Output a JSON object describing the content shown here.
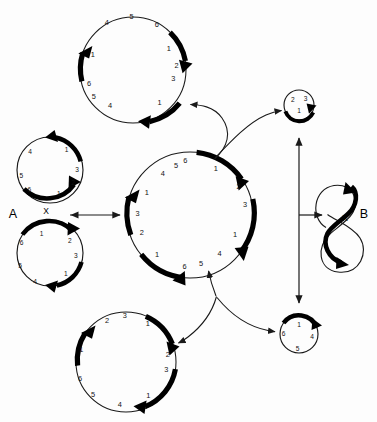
{
  "figure": {
    "title": "",
    "background_color": "#fdfdfd",
    "ink_color": "#000000",
    "width": 377,
    "height": 422
  },
  "labels": {
    "a": "A",
    "b": "B",
    "x_left": "X",
    "x_right": "X"
  },
  "chromosomes": {
    "center": {
      "name": "center-ring",
      "cx": 190,
      "cy": 215,
      "r": 63,
      "markers": [
        "6",
        "1",
        "2",
        "3",
        "1",
        "4",
        "5",
        "6",
        "1",
        "2",
        "3",
        "1",
        "4",
        "5"
      ]
    },
    "top": {
      "name": "top-ring",
      "cx": 133,
      "cy": 70,
      "r": 53,
      "markers": [
        "4",
        "5",
        "6",
        "1",
        "2",
        "3",
        "1",
        "4",
        "5",
        "6",
        "1"
      ]
    },
    "bottom": {
      "name": "bottom-ring",
      "cx": 126,
      "cy": 362,
      "r": 50,
      "markers": [
        "2",
        "3",
        "1",
        "2",
        "3",
        "1",
        "4",
        "5",
        "6",
        "1"
      ]
    },
    "upper_left": {
      "name": "upper-left-ring",
      "cx": 50,
      "cy": 170,
      "r": 33,
      "markers": [
        "1",
        "3",
        "2",
        "1",
        "6",
        "5",
        "4"
      ]
    },
    "lower_left": {
      "name": "lower-left-ring",
      "cx": 50,
      "cy": 253,
      "r": 33,
      "markers": [
        "1",
        "2",
        "3",
        "1",
        "4",
        "5",
        "6"
      ]
    },
    "small_top_right": {
      "name": "small-top-right-ring",
      "cx": 299,
      "cy": 105,
      "r": 15,
      "markers": [
        "2",
        "3",
        "1"
      ]
    },
    "small_bottom_right": {
      "name": "small-bottom-right-ring",
      "cx": 299,
      "cy": 334,
      "r": 19,
      "markers": [
        "1",
        "4",
        "5",
        "6"
      ]
    },
    "figure_eight": {
      "name": "figure-eight-ring",
      "upper_cx": 340,
      "upper_cy": 200,
      "upper_r": 17,
      "lower_cx": 342,
      "lower_cy": 246,
      "lower_r": 24
    }
  },
  "marker_values": {
    "center": [
      {
        "v": "6",
        "ang": -95
      },
      {
        "v": "1",
        "ang": -62
      },
      {
        "v": "2",
        "ang": -30
      },
      {
        "v": "3",
        "ang": -10
      },
      {
        "v": "1",
        "ang": 22
      },
      {
        "v": "4",
        "ang": 50
      },
      {
        "v": "5",
        "ang": 73
      },
      {
        "v": "6",
        "ang": 95
      },
      {
        "v": "1",
        "ang": 122
      },
      {
        "v": "2",
        "ang": 152
      },
      {
        "v": "3",
        "ang": 172
      },
      {
        "v": "1",
        "ang": 203
      },
      {
        "v": "4",
        "ang": 232
      },
      {
        "v": "5",
        "ang": 255
      }
    ],
    "top": [
      {
        "v": "4",
        "ang": -110
      },
      {
        "v": "5",
        "ang": -92
      },
      {
        "v": "6",
        "ang": -70
      },
      {
        "v": "1",
        "ang": -42
      },
      {
        "v": "2",
        "ang": -5
      },
      {
        "v": "3",
        "ang": 12
      },
      {
        "v": "1",
        "ang": 50
      },
      {
        "v": "4",
        "ang": 78
      },
      {
        "v": "5",
        "ang": 110
      },
      {
        "v": "6",
        "ang": 130
      },
      {
        "v": "1",
        "ang": 168
      }
    ],
    "bottom": [
      {
        "v": "2",
        "ang": -116
      },
      {
        "v": "3",
        "ang": -95
      },
      {
        "v": "1",
        "ang": -62
      },
      {
        "v": "2",
        "ang": -8
      },
      {
        "v": "3",
        "ang": 14
      },
      {
        "v": "1",
        "ang": 52
      },
      {
        "v": "4",
        "ang": 82
      },
      {
        "v": "5",
        "ang": 112
      },
      {
        "v": "6",
        "ang": 140
      },
      {
        "v": "1",
        "ang": 175
      }
    ],
    "upper_left": [
      {
        "v": "1",
        "ang": -52
      },
      {
        "v": "3",
        "ang": 0
      },
      {
        "v": "2",
        "ang": 30
      },
      {
        "v": "1",
        "ang": 70
      },
      {
        "v": "6",
        "ang": 128
      },
      {
        "v": "5",
        "ang": 168
      },
      {
        "v": "4",
        "ang": -148
      }
    ],
    "lower_left": [
      {
        "v": "1",
        "ang": -70
      },
      {
        "v": "2",
        "ang": -26
      },
      {
        "v": "3",
        "ang": 4
      },
      {
        "v": "1",
        "ang": 48
      },
      {
        "v": "4",
        "ang": 108
      },
      {
        "v": "5",
        "ang": 155
      },
      {
        "v": "6",
        "ang": -160
      }
    ],
    "small_top_right": [
      {
        "v": "2",
        "ang": -132
      },
      {
        "v": "3",
        "ang": -50
      },
      {
        "v": "1",
        "ang": 62
      }
    ],
    "small_bottom_right": [
      {
        "v": "1",
        "ang": -78
      },
      {
        "v": "4",
        "ang": 5
      },
      {
        "v": "5",
        "ang": 72
      },
      {
        "v": "6",
        "ang": 178
      }
    ]
  },
  "arrows": {
    "center_to_top": "curved-arrow-up-left",
    "center_to_small_top_right": "curved-arrow-up-right",
    "center_to_bottom": "curved-arrow-down-left",
    "center_to_small_bottom_right": "curved-arrow-down-right",
    "left_pair_to_center": "double-headed-horizontal-arrow",
    "right_vertical": "double-headed-vertical-arrow",
    "right_branch": "arrow-to-figure-eight"
  }
}
